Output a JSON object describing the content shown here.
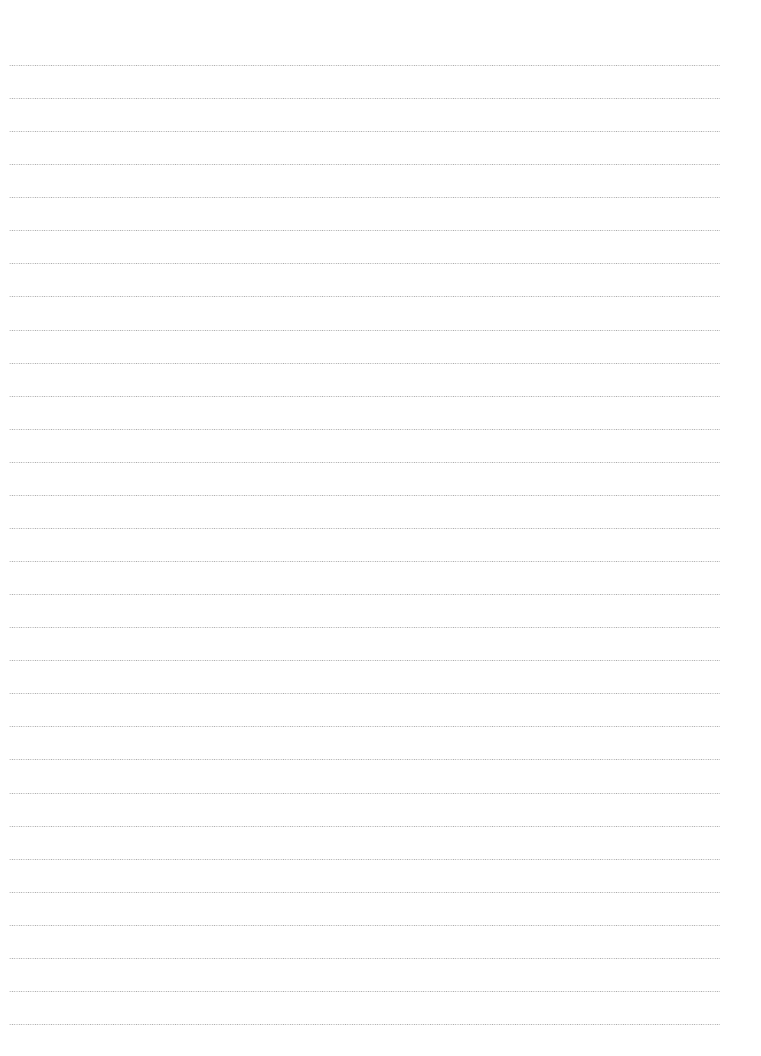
{
  "page": {
    "type": "lined-writing-paper",
    "background_color": "#ffffff",
    "rule_color": "#9a9a9a",
    "rule_style": "dotted",
    "rule_count": 30,
    "first_rule_y": 65,
    "rule_spacing": 33.07,
    "rule_left": 9,
    "rule_right": 720,
    "text_lines": []
  }
}
